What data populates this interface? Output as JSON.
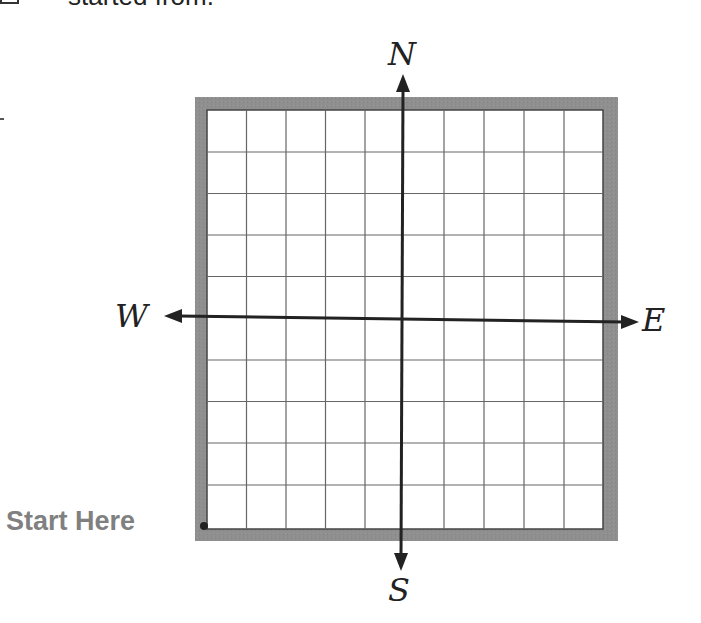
{
  "header": {
    "partial_text": "started from.",
    "checkbox_checked": false
  },
  "diagram": {
    "type": "compass-grid",
    "grid_columns": 10,
    "grid_rows": 10,
    "frame_color": "#8c8c8c",
    "grid_line_color": "#555555",
    "axis_color": "#222222",
    "compass": {
      "north": "N",
      "south": "S",
      "west": "W",
      "east": "E"
    },
    "start_label": "Start Here",
    "start_label_color": "#808080",
    "start_point": "bottom-left corner"
  }
}
